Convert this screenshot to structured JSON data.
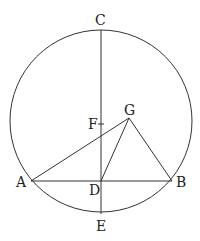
{
  "diagram": {
    "type": "geometry",
    "elements": [
      "circle",
      "chord AB",
      "diameter CE",
      "triangle AGB",
      "segment DG",
      "point F"
    ],
    "points": {
      "A": "A",
      "B": "B",
      "C": "C",
      "D": "D",
      "E": "E",
      "F": "F",
      "G": "G"
    },
    "color": "#333333"
  }
}
